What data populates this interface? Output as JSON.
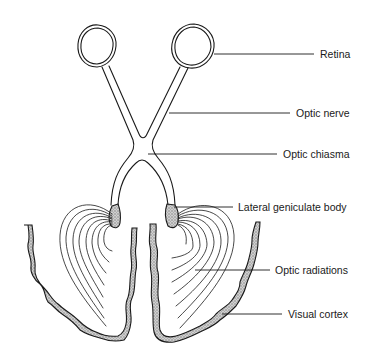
{
  "diagram": {
    "colors": {
      "line": "#1a1a1a",
      "stipple_fill": "#b8b8b8",
      "background": "#ffffff"
    },
    "labels": [
      {
        "id": "retina",
        "text": "Retina",
        "x": 320,
        "y": 48
      },
      {
        "id": "optic-nerve",
        "text": "Optic nerve",
        "x": 296,
        "y": 107
      },
      {
        "id": "optic-chiasma",
        "text": "Optic chiasma",
        "x": 283,
        "y": 148
      },
      {
        "id": "lateral-geniculate-body",
        "text": "Lateral geniculate body",
        "x": 238,
        "y": 201
      },
      {
        "id": "optic-radiations",
        "text": "Optic radiations",
        "x": 275,
        "y": 264
      },
      {
        "id": "visual-cortex",
        "text": "Visual cortex",
        "x": 288,
        "y": 308
      }
    ]
  }
}
